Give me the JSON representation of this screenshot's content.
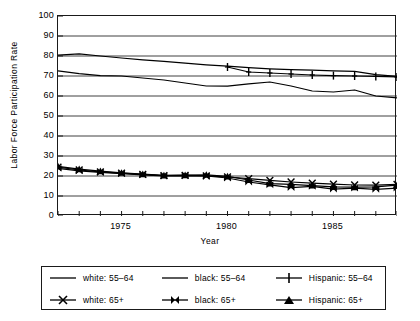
{
  "chart_data": {
    "type": "line",
    "title": "",
    "xlabel": "Year",
    "ylabel": "Labor Force Participation Rate",
    "xlim": [
      1972,
      1988
    ],
    "ylim": [
      0,
      100
    ],
    "ytick_step": 10,
    "grid": true,
    "grid_axis": "y",
    "legend_position": "bottom",
    "x": [
      1972,
      1973,
      1974,
      1975,
      1976,
      1977,
      1978,
      1979,
      1980,
      1981,
      1982,
      1983,
      1984,
      1985,
      1986,
      1987,
      1988
    ],
    "ytick_labels": [
      "0",
      "10",
      "20",
      "30",
      "40",
      "50",
      "60",
      "70",
      "80",
      "90",
      "100"
    ],
    "xtick_labels": [
      "1975",
      "1980",
      "1985"
    ],
    "xtick_values": [
      1975,
      1980,
      1985
    ],
    "series": [
      {
        "name": "white: 55-64",
        "label": "white: 55–64",
        "marker": "none",
        "color": "#000000",
        "x": [
          1972,
          1973,
          1974,
          1975,
          1976,
          1977,
          1978,
          1979,
          1980,
          1981,
          1982,
          1983,
          1984,
          1985,
          1986,
          1987,
          1988
        ],
        "values": [
          80.4,
          81.1,
          80.0,
          79.0,
          78.1,
          77.3,
          76.4,
          75.6,
          74.9,
          74.2,
          73.6,
          73.2,
          72.9,
          72.6,
          72.3,
          70.7,
          69.8
        ]
      },
      {
        "name": "black: 55-64",
        "label": "black: 55–64",
        "marker": "none",
        "color": "#000000",
        "x": [
          1972,
          1973,
          1974,
          1975,
          1976,
          1977,
          1978,
          1979,
          1980,
          1981,
          1982,
          1983,
          1984,
          1985,
          1986,
          1987,
          1988
        ],
        "values": [
          72.6,
          71.2,
          70.2,
          70.0,
          69.0,
          68.0,
          66.5,
          65.0,
          64.9,
          66.1,
          67.0,
          65.0,
          62.5,
          62.0,
          63.0,
          60.0,
          59.0
        ]
      },
      {
        "name": "Hispanic: 55-64",
        "label": "Hispanic: 55–64",
        "marker": "plus",
        "color": "#000000",
        "x": [
          1980,
          1981,
          1982,
          1983,
          1984,
          1985,
          1986,
          1987,
          1988
        ],
        "values": [
          74.5,
          72.0,
          71.5,
          71.0,
          70.5,
          70.2,
          70.0,
          69.8,
          69.5
        ]
      },
      {
        "name": "white: 65+",
        "label": "white: 65+",
        "marker": "x",
        "color": "#000000",
        "x": [
          1972,
          1973,
          1974,
          1975,
          1976,
          1977,
          1978,
          1979,
          1980,
          1981,
          1982,
          1983,
          1984,
          1985,
          1986,
          1987,
          1988
        ],
        "values": [
          24.4,
          23.0,
          22.1,
          21.4,
          20.8,
          20.2,
          20.3,
          20.1,
          19.5,
          18.7,
          17.8,
          17.0,
          16.4,
          15.9,
          15.5,
          15.4,
          15.8
        ]
      },
      {
        "name": "black: 65+",
        "label": "black: 65+",
        "marker": "bowtie",
        "color": "#000000",
        "x": [
          1972,
          1973,
          1974,
          1975,
          1976,
          1977,
          1978,
          1979,
          1980,
          1981,
          1982,
          1983,
          1984,
          1985,
          1986,
          1987,
          1988
        ],
        "values": [
          23.8,
          22.6,
          21.8,
          21.2,
          20.6,
          20.1,
          20.2,
          20.0,
          19.0,
          17.0,
          15.6,
          14.2,
          14.8,
          13.4,
          13.9,
          13.3,
          14.0
        ]
      },
      {
        "name": "Hispanic: 65+",
        "label": "Hispanic: 65+",
        "marker": "triangle",
        "color": "#000000",
        "x": [
          1972,
          1973,
          1974,
          1975,
          1976,
          1977,
          1978,
          1979,
          1980,
          1981,
          1982,
          1983,
          1984,
          1985,
          1986,
          1987,
          1988
        ],
        "values": [
          24.8,
          23.4,
          22.4,
          21.6,
          20.9,
          20.3,
          20.4,
          20.6,
          19.8,
          18.0,
          16.2,
          15.8,
          15.2,
          14.6,
          14.4,
          14.6,
          15.4
        ]
      }
    ]
  },
  "axes": {
    "y_title": "Labor Force Participation Rate",
    "x_title": "Year"
  }
}
